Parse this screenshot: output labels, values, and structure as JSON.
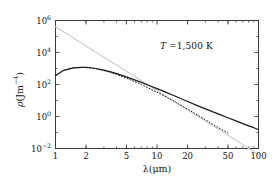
{
  "figure": {
    "background": "#ffffff",
    "frame_color": "#3a3a3a"
  },
  "axes": {
    "x_title": "λ(μm)",
    "y_title_rho": "ρ(Jm",
    "y_title_exp": "−4",
    "y_title_close": ")",
    "x_ticks": [
      "1",
      "2",
      "5",
      "10",
      "20",
      "50",
      "100"
    ],
    "x_tick_values": [
      1,
      2,
      5,
      10,
      20,
      50,
      100
    ],
    "y_tick_mantissa": "10",
    "y_tick_exponents": [
      "6",
      "4",
      "2",
      "0",
      "−2"
    ],
    "y_tick_values": [
      1000000,
      10000,
      100,
      1,
      0.01
    ]
  },
  "annotations": {
    "temperature_symbol": "T",
    "temperature_equals": " =1,500 K"
  },
  "chart_data": {
    "type": "line",
    "title": "",
    "subtitle": "",
    "xlabel": "λ(μm)",
    "ylabel": "ρ(Jm⁻⁴)",
    "xscale": "log",
    "yscale": "log",
    "xlim": [
      1,
      100
    ],
    "ylim": [
      0.01,
      1000000
    ],
    "grid": false,
    "legend_position": "none",
    "annotations": [
      {
        "text": "T =1,500 K",
        "x": 22,
        "y": 40000
      }
    ],
    "series": [
      {
        "name": "Planck",
        "style": "solid",
        "color": "#1a1a1a",
        "width": 1.2,
        "x": [
          1,
          1.2,
          1.5,
          1.8,
          2.0,
          2.2,
          2.5,
          3.0,
          3.5,
          4.0,
          5.0,
          6.0,
          7.0,
          8.0,
          10.0,
          12.0,
          15.0,
          20.0,
          25.0,
          30.0,
          40.0,
          50.0,
          60.0,
          70.0,
          80.0,
          90.0,
          100.0
        ],
        "y": [
          370,
          760,
          1090,
          1180,
          1160,
          1110,
          1000,
          790,
          610,
          480,
          300,
          196,
          135,
          97,
          55,
          34.5,
          19.0,
          8.7,
          4.8,
          3.0,
          1.45,
          0.83,
          0.53,
          0.36,
          0.26,
          0.2,
          0.15
        ]
      },
      {
        "name": "Wien approximation",
        "style": "dotted",
        "color": "#1a1a1a",
        "width": 1.0,
        "x": [
          1,
          1.2,
          1.5,
          1.8,
          2.0,
          2.2,
          2.5,
          3.0,
          3.5,
          4.0,
          5.0,
          6.0,
          7.0,
          8.0,
          10.0,
          12.0,
          15.0,
          20.0,
          25.0,
          30.0,
          40.0,
          50.0
        ],
        "y": [
          370,
          758,
          1080,
          1165,
          1140,
          1085,
          965,
          745,
          560,
          425,
          248,
          152,
          98,
          66,
          33,
          18.2,
          8.4,
          2.9,
          1.25,
          0.62,
          0.205,
          0.092
        ]
      },
      {
        "name": "Rayleigh-Jeans",
        "style": "solid",
        "color": "#d0d0d0",
        "width": 1.2,
        "x": [
          1,
          2,
          5,
          10,
          20,
          50,
          100
        ],
        "y": [
          414000,
          25900,
          663,
          41.4,
          2.59,
          0.0663,
          0.0041
        ]
      }
    ]
  }
}
